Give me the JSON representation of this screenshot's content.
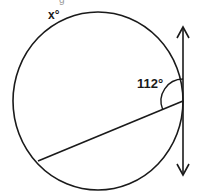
{
  "diagram": {
    "type": "geometry",
    "labels": {
      "arc_label": "x°",
      "angle_label": "112°",
      "top_partial_text": "g"
    },
    "elements": {
      "circle": {
        "cx": 98,
        "cy": 101,
        "rx": 85,
        "ry": 89
      },
      "tangent_line": {
        "x": 183,
        "y_top": 27,
        "y_bottom": 175,
        "arrows": "both"
      },
      "chord": {
        "x1": 38,
        "y1": 161,
        "x2": 183,
        "y2": 101
      },
      "angle_arc": {
        "vertex_x": 183,
        "vertex_y": 101,
        "radius": 22,
        "measure": 112
      }
    },
    "colors": {
      "stroke": "#1a1a1a",
      "background": "#ffffff"
    }
  }
}
